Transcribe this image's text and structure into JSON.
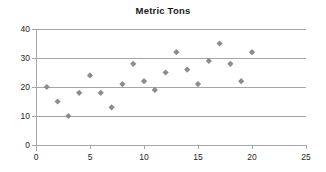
{
  "chart_data": {
    "type": "scatter",
    "title": "Metric Tons",
    "xlabel": "",
    "ylabel": "",
    "xlim": [
      0,
      25
    ],
    "ylim": [
      0,
      40
    ],
    "xticks": [
      0,
      5,
      10,
      15,
      20,
      25
    ],
    "yticks": [
      0,
      10,
      20,
      30,
      40
    ],
    "grid": "horizontal",
    "legend": "none",
    "marker_shape": "diamond",
    "marker_color": "#8c8c8c",
    "series": [
      {
        "name": "Metric Tons",
        "points": [
          {
            "x": 1,
            "y": 20
          },
          {
            "x": 2,
            "y": 15
          },
          {
            "x": 3,
            "y": 10
          },
          {
            "x": 4,
            "y": 18
          },
          {
            "x": 5,
            "y": 24
          },
          {
            "x": 6,
            "y": 18
          },
          {
            "x": 7,
            "y": 13
          },
          {
            "x": 8,
            "y": 21
          },
          {
            "x": 9,
            "y": 28
          },
          {
            "x": 10,
            "y": 22
          },
          {
            "x": 11,
            "y": 19
          },
          {
            "x": 12,
            "y": 25
          },
          {
            "x": 13,
            "y": 32
          },
          {
            "x": 14,
            "y": 26
          },
          {
            "x": 15,
            "y": 21
          },
          {
            "x": 16,
            "y": 29
          },
          {
            "x": 17,
            "y": 35
          },
          {
            "x": 18,
            "y": 28
          },
          {
            "x": 19,
            "y": 22
          },
          {
            "x": 20,
            "y": 32
          }
        ]
      }
    ]
  }
}
